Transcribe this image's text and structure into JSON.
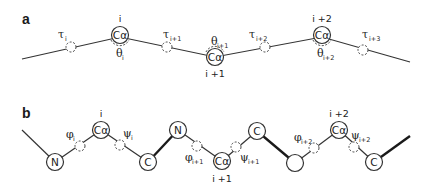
{
  "panels": {
    "a": {
      "label": "a",
      "nodes": [
        {
          "symbol": "Cα",
          "index": "i",
          "angle": {
            "greek": "θ",
            "sub": "i"
          }
        },
        {
          "symbol": "Cα",
          "index": "i +1",
          "angle": {
            "greek": "θ",
            "sub": "i+1"
          }
        },
        {
          "symbol": "Cα",
          "index": "i +2",
          "angle": {
            "greek": "θ",
            "sub": "i+2"
          }
        }
      ],
      "torsions": [
        {
          "greek": "τ",
          "sub": "i"
        },
        {
          "greek": "τ",
          "sub": "i+1"
        },
        {
          "greek": "τ",
          "sub": "i+2"
        },
        {
          "greek": "τ",
          "sub": "i+3"
        }
      ]
    },
    "b": {
      "label": "b",
      "atoms": [
        {
          "symbol": "N"
        },
        {
          "symbol": "Cα",
          "index": "i"
        },
        {
          "symbol": "C"
        },
        {
          "symbol": "N"
        },
        {
          "symbol": "Cα",
          "index": "i +1"
        },
        {
          "symbol": "C"
        },
        {
          "symbol": ""
        },
        {
          "symbol": "Cα",
          "index": "i +2"
        },
        {
          "symbol": "C"
        }
      ],
      "torsions": [
        {
          "greek": "φ",
          "sub": "i"
        },
        {
          "greek": "ψ",
          "sub": "i"
        },
        {
          "greek": "φ",
          "sub": "i+1"
        },
        {
          "greek": "ψ",
          "sub": "i+1"
        },
        {
          "greek": "φ",
          "sub": "i+2"
        },
        {
          "greek": "ψ",
          "sub": "i+2"
        }
      ]
    }
  }
}
